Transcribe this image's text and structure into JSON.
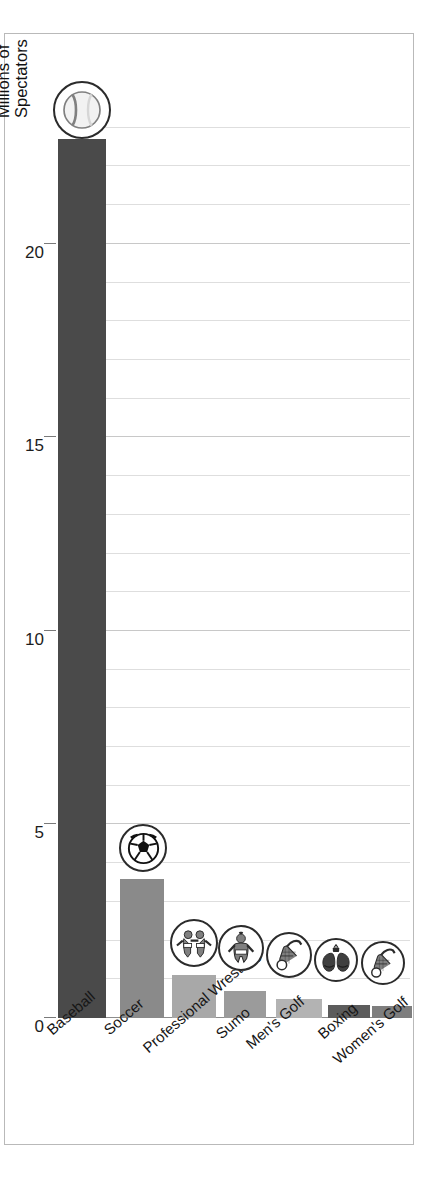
{
  "chart_data": {
    "type": "bar",
    "title": "",
    "xlabel": "",
    "ylabel": "Millions of\nSpectators",
    "ylim": [
      0,
      23.2
    ],
    "ytick_values": [
      0,
      5,
      10,
      15,
      20
    ],
    "ytick_labels": [
      "0",
      "5",
      "10",
      "15",
      "20"
    ],
    "grid": true,
    "grid_minor_step": 1,
    "legend": "none",
    "categories": [
      "Baseball",
      "Soccer",
      "Professional Wrestling",
      "Sumo",
      "Men's Golf",
      "Boxing",
      "Women's Golf"
    ],
    "values": [
      22.7,
      3.6,
      1.1,
      0.7,
      0.5,
      0.33,
      0.3
    ],
    "bar_colors": [
      "#4a4a4a",
      "#8a8a8a",
      "#a8a8a8",
      "#9b9b9b",
      "#b3b3b3",
      "#5c5c5c",
      "#7e7e7e"
    ],
    "bar_icons": [
      "baseball-icon",
      "soccer-ball-icon",
      "wrestlers-icon",
      "sumo-wrestler-icon",
      "golf-bag-icon",
      "boxing-gloves-icon",
      "golf-bag-icon"
    ]
  },
  "axis": {
    "y_title_line1": "Millions of",
    "y_title_line2": "Spectators"
  },
  "frame": {
    "border_color": "#b9b9b9",
    "background": "#ffffff"
  }
}
